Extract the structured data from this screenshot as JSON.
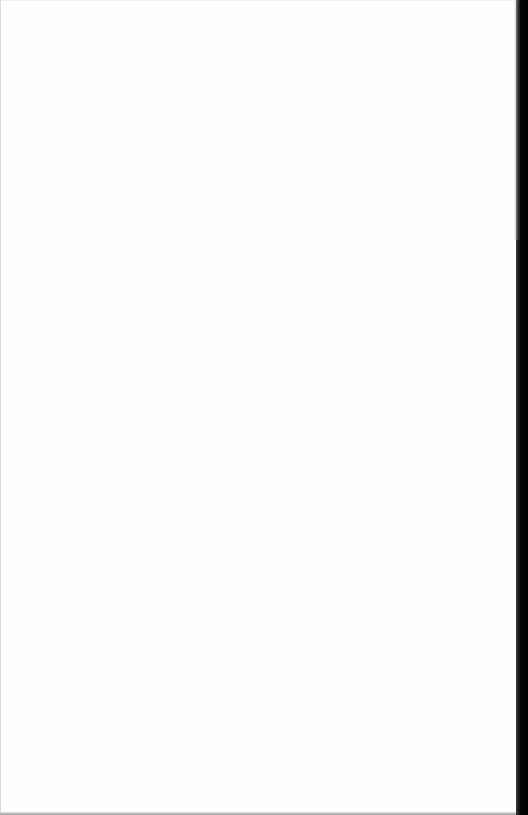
{
  "document": {
    "type": "scanned-page",
    "content": "",
    "is_blank": true
  },
  "colors": {
    "page": "#fefefe",
    "right_edge": "#000000",
    "bottom_edge": "#9a9a9a"
  }
}
